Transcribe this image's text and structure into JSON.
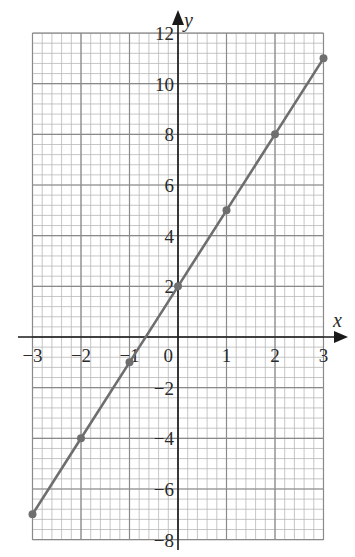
{
  "chart_data": {
    "type": "line",
    "title": "",
    "xlabel": "x",
    "ylabel": "y",
    "xlim": [
      -3,
      3
    ],
    "ylim": [
      -8,
      12
    ],
    "grid": true,
    "grid_minor_x": 0.2,
    "grid_minor_y": 0.4,
    "grid_major_x": 1,
    "grid_major_y": 2,
    "x_ticks": [
      "-3",
      "-2",
      "-1",
      "0",
      "1",
      "2",
      "3"
    ],
    "y_ticks": [
      "-8",
      "-6",
      "-4",
      "-2",
      "2",
      "4",
      "6",
      "8",
      "10",
      "12"
    ],
    "series": [
      {
        "name": "y = 3x + 2",
        "x": [
          -3,
          -2,
          -1,
          0,
          1,
          2,
          3
        ],
        "y": [
          -7,
          -4,
          -1,
          2,
          5,
          8,
          11
        ],
        "markers": true
      }
    ],
    "colors": {
      "line": "#6e6e6e",
      "marker": "#6e6e6e",
      "grid_minor": "#b8b8b8",
      "grid_major": "#8a8a8a",
      "axis": "#1a1a1a"
    }
  }
}
